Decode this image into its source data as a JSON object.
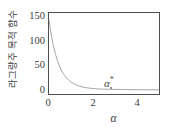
{
  "chart_data": {
    "type": "line",
    "title": "",
    "xlabel": "α",
    "ylabel": "라그랑주 목적 함수",
    "xlim": [
      0,
      5
    ],
    "ylim": [
      -8,
      155
    ],
    "xticks": [
      0,
      2,
      4
    ],
    "xticklabels": [
      "0",
      "2",
      "4"
    ],
    "yticks": [
      0,
      50,
      100,
      150
    ],
    "yticklabels": [
      "0",
      "50",
      "100",
      "150"
    ],
    "grid": false,
    "legend": null,
    "line_color": "#9a9a9a",
    "axis_color": "#4d4d4d",
    "series": [
      {
        "name": "Lagrangian objective",
        "x": [
          0.0,
          0.1,
          0.2,
          0.3,
          0.4,
          0.5,
          0.6,
          0.7,
          0.8,
          0.9,
          1.0,
          1.2,
          1.4,
          1.6,
          1.8,
          2.0,
          2.25,
          2.5,
          2.75,
          3.0,
          3.25,
          3.5,
          3.75,
          4.0,
          4.25,
          4.5,
          4.75,
          5.0
        ],
        "y": [
          140.0,
          112.0,
          89.0,
          71.0,
          57.0,
          45.5,
          36.5,
          29.5,
          24.0,
          19.5,
          16.0,
          11.0,
          7.6,
          5.4,
          4.0,
          3.0,
          2.2,
          1.7,
          1.4,
          1.2,
          1.0,
          0.9,
          0.8,
          0.7,
          0.6,
          0.5,
          0.5,
          0.4
        ]
      }
    ],
    "annotations": [
      {
        "text": "α",
        "superscript": "*",
        "x": 3.1,
        "y": 0.0,
        "marker": "dot"
      }
    ]
  }
}
